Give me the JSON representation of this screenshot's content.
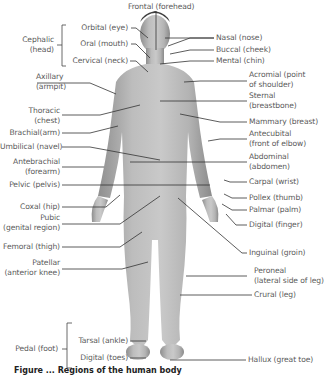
{
  "figure": {
    "caption_partial": "Figure ... Regions of the human body",
    "title_top": "Frontal (forehead)",
    "left_labels": {
      "cephalic": {
        "line1": "Cephalic",
        "line2": "(head)"
      },
      "orbital": "Orbital (eye)",
      "oral": "Oral (mouth)",
      "cervical": "Cervical (neck)",
      "axillary": {
        "line1": "Axillary",
        "line2": "(armpit)"
      },
      "thoracic": {
        "line1": "Thoracic",
        "line2": "(chest)"
      },
      "brachial": "Brachial(arm)",
      "umbilical": "Umbilical (navel)",
      "antebrachial": {
        "line1": "Antebrachial",
        "line2": "(forearm)"
      },
      "pelvic": "Pelvic (pelvis)",
      "coxal": "Coxal (hip)",
      "pubic": {
        "line1": "Pubic",
        "line2": "(genital region)"
      },
      "femoral": "Femoral (thigh)",
      "patellar": {
        "line1": "Patellar",
        "line2": "(anterior knee)"
      },
      "pedal": "Pedal (foot)",
      "tarsal": "Tarsal (ankle)",
      "digital_toes": "Digital (toes)"
    },
    "right_labels": {
      "nasal": "Nasal (nose)",
      "buccal": "Buccal (cheek)",
      "mental": "Mental (chin)",
      "acromial": {
        "line1": "Acromial (point",
        "line2": "of shoulder)"
      },
      "sternal": {
        "line1": "Sternal",
        "line2": "(breastbone)"
      },
      "mammary": "Mammary (breast)",
      "antecubital": {
        "line1": "Antecubital",
        "line2": "(front of elbow)"
      },
      "abdominal": {
        "line1": "Abdominal",
        "line2": "(abdomen)"
      },
      "carpal": "Carpal (wrist)",
      "pollex": "Pollex (thumb)",
      "palmar": "Palmar (palm)",
      "digital_finger": "Digital (finger)",
      "inguinal": "Inguinal (groin)",
      "peroneal": {
        "line1": "Peroneal",
        "line2": "(lateral side of leg)"
      },
      "crural": "Crural (leg)",
      "hallux": "Hallux (great toe)"
    }
  }
}
